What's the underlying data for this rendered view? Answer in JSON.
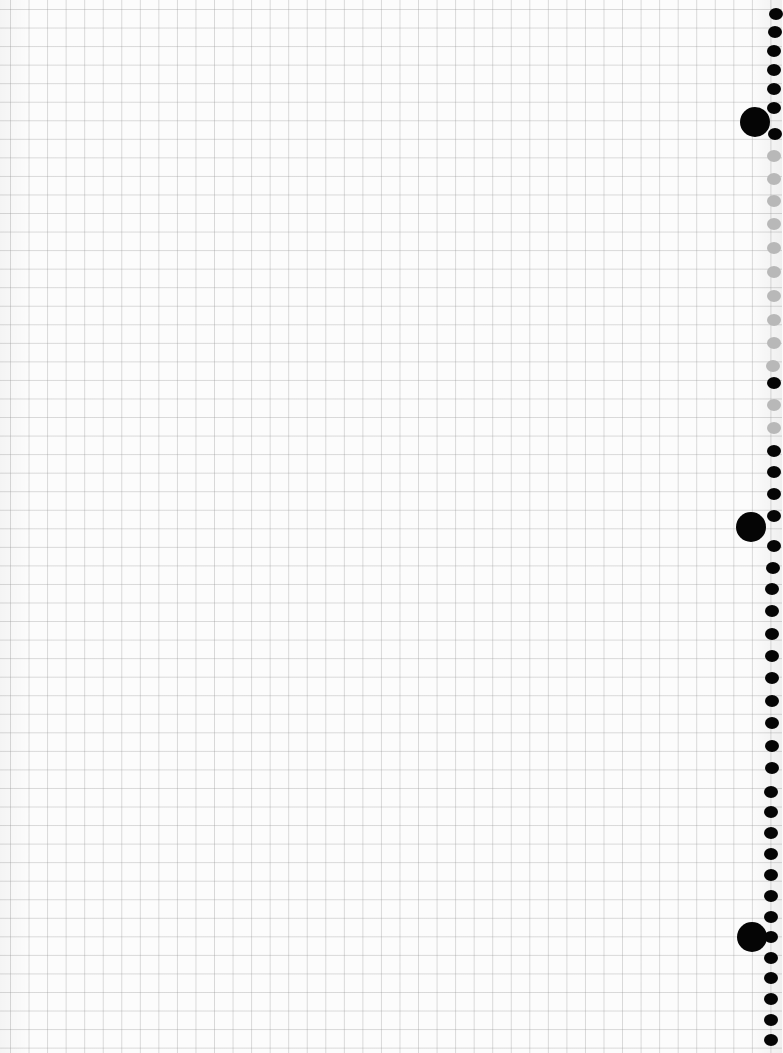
{
  "page": {
    "type": "graph-paper-sheet",
    "background_color": "#fcfcfc",
    "grid_color": "#c8c8c8",
    "grid_spacing_px": 18.55
  },
  "binding": {
    "side": "right",
    "hole_color_dark": "#050505",
    "hole_color_light": "#b8b8b8",
    "small_holes": [
      {
        "x": 769,
        "y": 8,
        "c": "dark"
      },
      {
        "x": 768,
        "y": 26,
        "c": "dark"
      },
      {
        "x": 767,
        "y": 45,
        "c": "dark"
      },
      {
        "x": 767,
        "y": 64,
        "c": "dark"
      },
      {
        "x": 767,
        "y": 83,
        "c": "dark"
      },
      {
        "x": 767,
        "y": 102,
        "c": "dark"
      },
      {
        "x": 768,
        "y": 128,
        "c": "dark"
      },
      {
        "x": 767,
        "y": 150,
        "c": "light"
      },
      {
        "x": 767,
        "y": 173,
        "c": "light"
      },
      {
        "x": 767,
        "y": 195,
        "c": "light"
      },
      {
        "x": 767,
        "y": 218,
        "c": "light"
      },
      {
        "x": 767,
        "y": 242,
        "c": "light"
      },
      {
        "x": 767,
        "y": 266,
        "c": "light"
      },
      {
        "x": 767,
        "y": 290,
        "c": "light"
      },
      {
        "x": 767,
        "y": 314,
        "c": "light"
      },
      {
        "x": 767,
        "y": 337,
        "c": "light"
      },
      {
        "x": 766,
        "y": 360,
        "c": "light"
      },
      {
        "x": 767,
        "y": 377,
        "c": "dark"
      },
      {
        "x": 767,
        "y": 399,
        "c": "light"
      },
      {
        "x": 767,
        "y": 422,
        "c": "light"
      },
      {
        "x": 767,
        "y": 445,
        "c": "dark"
      },
      {
        "x": 767,
        "y": 466,
        "c": "dark"
      },
      {
        "x": 767,
        "y": 488,
        "c": "dark"
      },
      {
        "x": 767,
        "y": 510,
        "c": "dark"
      },
      {
        "x": 767,
        "y": 540,
        "c": "dark"
      },
      {
        "x": 766,
        "y": 562,
        "c": "dark"
      },
      {
        "x": 765,
        "y": 583,
        "c": "dark"
      },
      {
        "x": 765,
        "y": 605,
        "c": "dark"
      },
      {
        "x": 765,
        "y": 628,
        "c": "dark"
      },
      {
        "x": 765,
        "y": 650,
        "c": "dark"
      },
      {
        "x": 765,
        "y": 672,
        "c": "dark"
      },
      {
        "x": 765,
        "y": 695,
        "c": "dark"
      },
      {
        "x": 765,
        "y": 717,
        "c": "dark"
      },
      {
        "x": 765,
        "y": 740,
        "c": "dark"
      },
      {
        "x": 765,
        "y": 762,
        "c": "dark"
      },
      {
        "x": 764,
        "y": 786,
        "c": "dark"
      },
      {
        "x": 764,
        "y": 806,
        "c": "dark"
      },
      {
        "x": 764,
        "y": 827,
        "c": "dark"
      },
      {
        "x": 764,
        "y": 848,
        "c": "dark"
      },
      {
        "x": 764,
        "y": 869,
        "c": "dark"
      },
      {
        "x": 764,
        "y": 890,
        "c": "dark"
      },
      {
        "x": 764,
        "y": 911,
        "c": "dark"
      },
      {
        "x": 764,
        "y": 931,
        "c": "dark"
      },
      {
        "x": 764,
        "y": 952,
        "c": "dark"
      },
      {
        "x": 764,
        "y": 972,
        "c": "dark"
      },
      {
        "x": 764,
        "y": 993,
        "c": "dark"
      },
      {
        "x": 764,
        "y": 1014,
        "c": "dark"
      },
      {
        "x": 764,
        "y": 1034,
        "c": "dark"
      }
    ],
    "big_holes": [
      {
        "x": 740,
        "y": 107
      },
      {
        "x": 736,
        "y": 512
      },
      {
        "x": 737,
        "y": 922
      }
    ]
  }
}
